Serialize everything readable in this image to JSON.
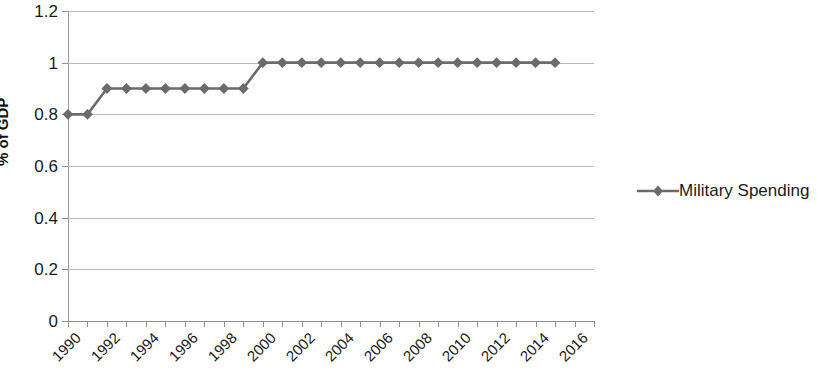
{
  "chart_data": {
    "type": "line",
    "title": "",
    "xlabel": "",
    "ylabel": "% of GDP",
    "ylim": [
      0,
      1.2
    ],
    "ytick_step": 0.2,
    "yticks": [
      "0",
      "0.2",
      "0.4",
      "0.6",
      "0.8",
      "1",
      "1.2"
    ],
    "xlim": [
      1990,
      2017
    ],
    "xtick_labels": [
      "1990",
      "1992",
      "1994",
      "1996",
      "1998",
      "2000",
      "2002",
      "2004",
      "2006",
      "2008",
      "2010",
      "2012",
      "2014",
      "2016"
    ],
    "xtick_step": 2,
    "grid": "horizontal",
    "legend_position": "right",
    "x": [
      1990,
      1991,
      1992,
      1993,
      1994,
      1995,
      1996,
      1997,
      1998,
      1999,
      2000,
      2001,
      2002,
      2003,
      2004,
      2005,
      2006,
      2007,
      2008,
      2009,
      2010,
      2011,
      2012,
      2013,
      2014,
      2015
    ],
    "series": [
      {
        "name": "Military Spending",
        "color": "#6b6b6b",
        "marker": "diamond",
        "values": [
          0.8,
          0.8,
          0.9,
          0.9,
          0.9,
          0.9,
          0.9,
          0.9,
          0.9,
          0.9,
          1.0,
          1.0,
          1.0,
          1.0,
          1.0,
          1.0,
          1.0,
          1.0,
          1.0,
          1.0,
          1.0,
          1.0,
          1.0,
          1.0,
          1.0,
          1.0
        ]
      }
    ]
  },
  "legend": {
    "entries": [
      {
        "label": "Military Spending"
      }
    ]
  },
  "axis": {
    "y_title": "% of GDP"
  }
}
